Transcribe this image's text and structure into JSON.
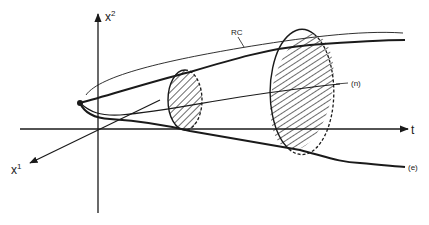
{
  "diagram": {
    "axes": {
      "vertical_label": "x",
      "vertical_superscript": "2",
      "depth_label": "x",
      "depth_superscript": "1",
      "horizontal_label": "t"
    },
    "labels": {
      "rc": "RC",
      "n": "(n)",
      "e": "(e)"
    },
    "colors": {
      "ink": "#1a1a1a",
      "background": "#ffffff"
    }
  }
}
